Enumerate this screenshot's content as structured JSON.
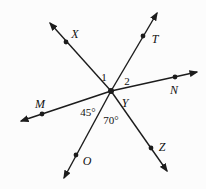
{
  "diagram": {
    "background_color": "#fcfcfc",
    "line_color": "#1c1c1c",
    "label_color": "#111111",
    "line_width": 1.4,
    "center": {
      "x": 111,
      "y": 91,
      "dot_radius": 3
    },
    "point_dot_radius": 2.4,
    "rays": [
      {
        "id": "X",
        "tip_x": 50,
        "tip_y": 23,
        "dot_x": 66,
        "dot_y": 42,
        "label": "X",
        "label_x": 75,
        "label_y": 34
      },
      {
        "id": "T",
        "tip_x": 157,
        "tip_y": 13,
        "dot_x": 143,
        "dot_y": 36,
        "label": "T",
        "label_x": 155,
        "label_y": 39
      },
      {
        "id": "N",
        "tip_x": 197,
        "tip_y": 72,
        "dot_x": 175,
        "dot_y": 77,
        "label": "N",
        "label_x": 174,
        "label_y": 90
      },
      {
        "id": "M",
        "tip_x": 21,
        "tip_y": 121,
        "dot_x": 42,
        "dot_y": 114,
        "label": "M",
        "label_x": 40,
        "label_y": 104
      },
      {
        "id": "O",
        "tip_x": 64,
        "tip_y": 178,
        "dot_x": 76,
        "dot_y": 155,
        "label": "O",
        "label_x": 87,
        "label_y": 161
      },
      {
        "id": "Z",
        "tip_x": 167,
        "tip_y": 171,
        "dot_x": 151,
        "dot_y": 148,
        "label": "Z",
        "label_x": 162,
        "label_y": 147
      }
    ],
    "angle_labels": [
      {
        "id": "angle-1",
        "text": "1",
        "x": 104,
        "y": 77
      },
      {
        "id": "angle-2",
        "text": "2",
        "x": 127,
        "y": 81
      },
      {
        "id": "angle-45",
        "text": "45°",
        "x": 88,
        "y": 112
      },
      {
        "id": "angle-70",
        "text": "70°",
        "x": 111,
        "y": 120
      }
    ],
    "vertex_label": {
      "text": "Y",
      "x": 125,
      "y": 103
    }
  }
}
